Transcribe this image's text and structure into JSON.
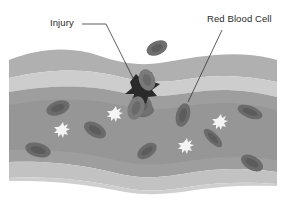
{
  "diagram": {
    "type": "blood-vessel-injury-illustration",
    "labels": {
      "injury": "Injury",
      "red_blood_cell": "Red Blood Cell"
    },
    "colors": {
      "background": "#ffffff",
      "vessel_outer_wall": "#b4b4b4",
      "vessel_light_band": "#cfcfcf",
      "vessel_lumen": "#9c9c9c",
      "vessel_lumen_dark": "#8e8e8e",
      "red_blood_cell": "#6e6e6e",
      "red_blood_cell_center": "#5a5a5a",
      "platelet": "#f4f4f4",
      "injury_clot": "#2c2c2c",
      "leader_line": "#333333",
      "label_text": "#2a2a2a"
    },
    "elements": [
      {
        "name": "blood-vessel",
        "description": "wavy horizontal vessel with layered walls"
      },
      {
        "name": "injury-site",
        "description": "dark clot at upper wall near center"
      },
      {
        "name": "red-blood-cells",
        "count": 10
      },
      {
        "name": "platelets",
        "count": 4
      }
    ]
  }
}
